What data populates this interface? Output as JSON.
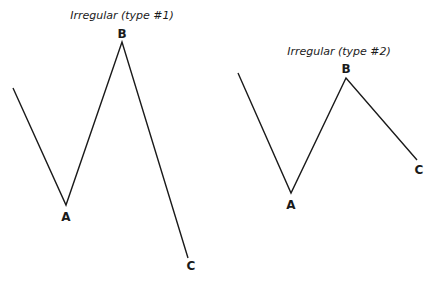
{
  "diagrams": [
    {
      "title": "Irregular (type #1)",
      "title_pos": [
        122,
        19
      ],
      "points": [
        [
          13,
          88
        ],
        [
          66,
          205
        ],
        [
          122,
          42
        ],
        [
          188,
          258
        ]
      ],
      "labels": [
        {
          "text": "A",
          "x": 66,
          "y": 221
        },
        {
          "text": "B",
          "x": 122,
          "y": 38
        },
        {
          "text": "C",
          "x": 191,
          "y": 270
        }
      ]
    },
    {
      "title": "Irregular (type #2)",
      "title_pos": [
        339,
        55
      ],
      "points": [
        [
          238,
          73
        ],
        [
          291,
          193
        ],
        [
          346,
          78
        ],
        [
          417,
          160
        ]
      ],
      "labels": [
        {
          "text": "A",
          "x": 291,
          "y": 209
        },
        {
          "text": "B",
          "x": 346,
          "y": 73
        },
        {
          "text": "C",
          "x": 419,
          "y": 174
        }
      ]
    }
  ],
  "colors": {
    "stroke": "#1a1a1a",
    "background": "#ffffff"
  }
}
